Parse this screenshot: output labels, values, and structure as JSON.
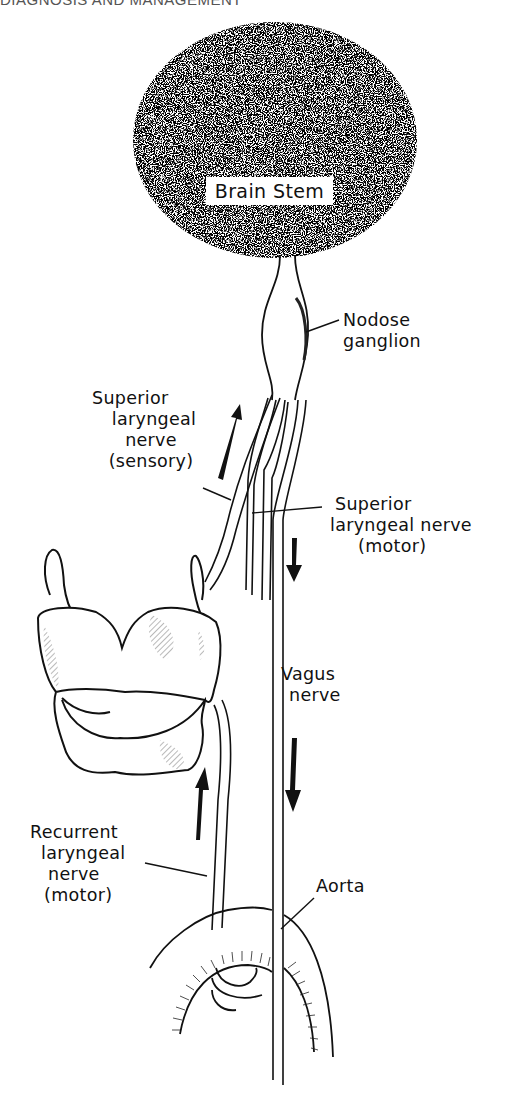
{
  "header": {
    "running_title": "DIAGNOSIS AND MANAGEMENT"
  },
  "diagram": {
    "structures": {
      "brain_stem": "Brain Stem",
      "nodose_ganglion": [
        "Nodose",
        "ganglion"
      ],
      "superior_laryngeal_sensory": [
        "Superior",
        "laryngeal",
        "nerve",
        "(sensory)"
      ],
      "superior_laryngeal_motor": [
        "Superior",
        "laryngeal nerve",
        "(motor)"
      ],
      "vagus_nerve": [
        "Vagus",
        "nerve"
      ],
      "recurrent_laryngeal_motor": [
        "Recurrent",
        "laryngeal",
        "nerve",
        "(motor)"
      ],
      "aorta": "Aorta"
    },
    "arrows": [
      {
        "id": "sensory-up",
        "direction": "up",
        "meaning": "sensory signal toward brain stem"
      },
      {
        "id": "motor-down-upper",
        "direction": "down",
        "meaning": "motor signal down vagus"
      },
      {
        "id": "motor-down-lower",
        "direction": "down",
        "meaning": "motor signal down vagus"
      },
      {
        "id": "recurrent-up",
        "direction": "up",
        "meaning": "recurrent nerve ascending to larynx"
      }
    ],
    "colors": {
      "ink": "#111111",
      "paper": "#ffffff"
    }
  }
}
